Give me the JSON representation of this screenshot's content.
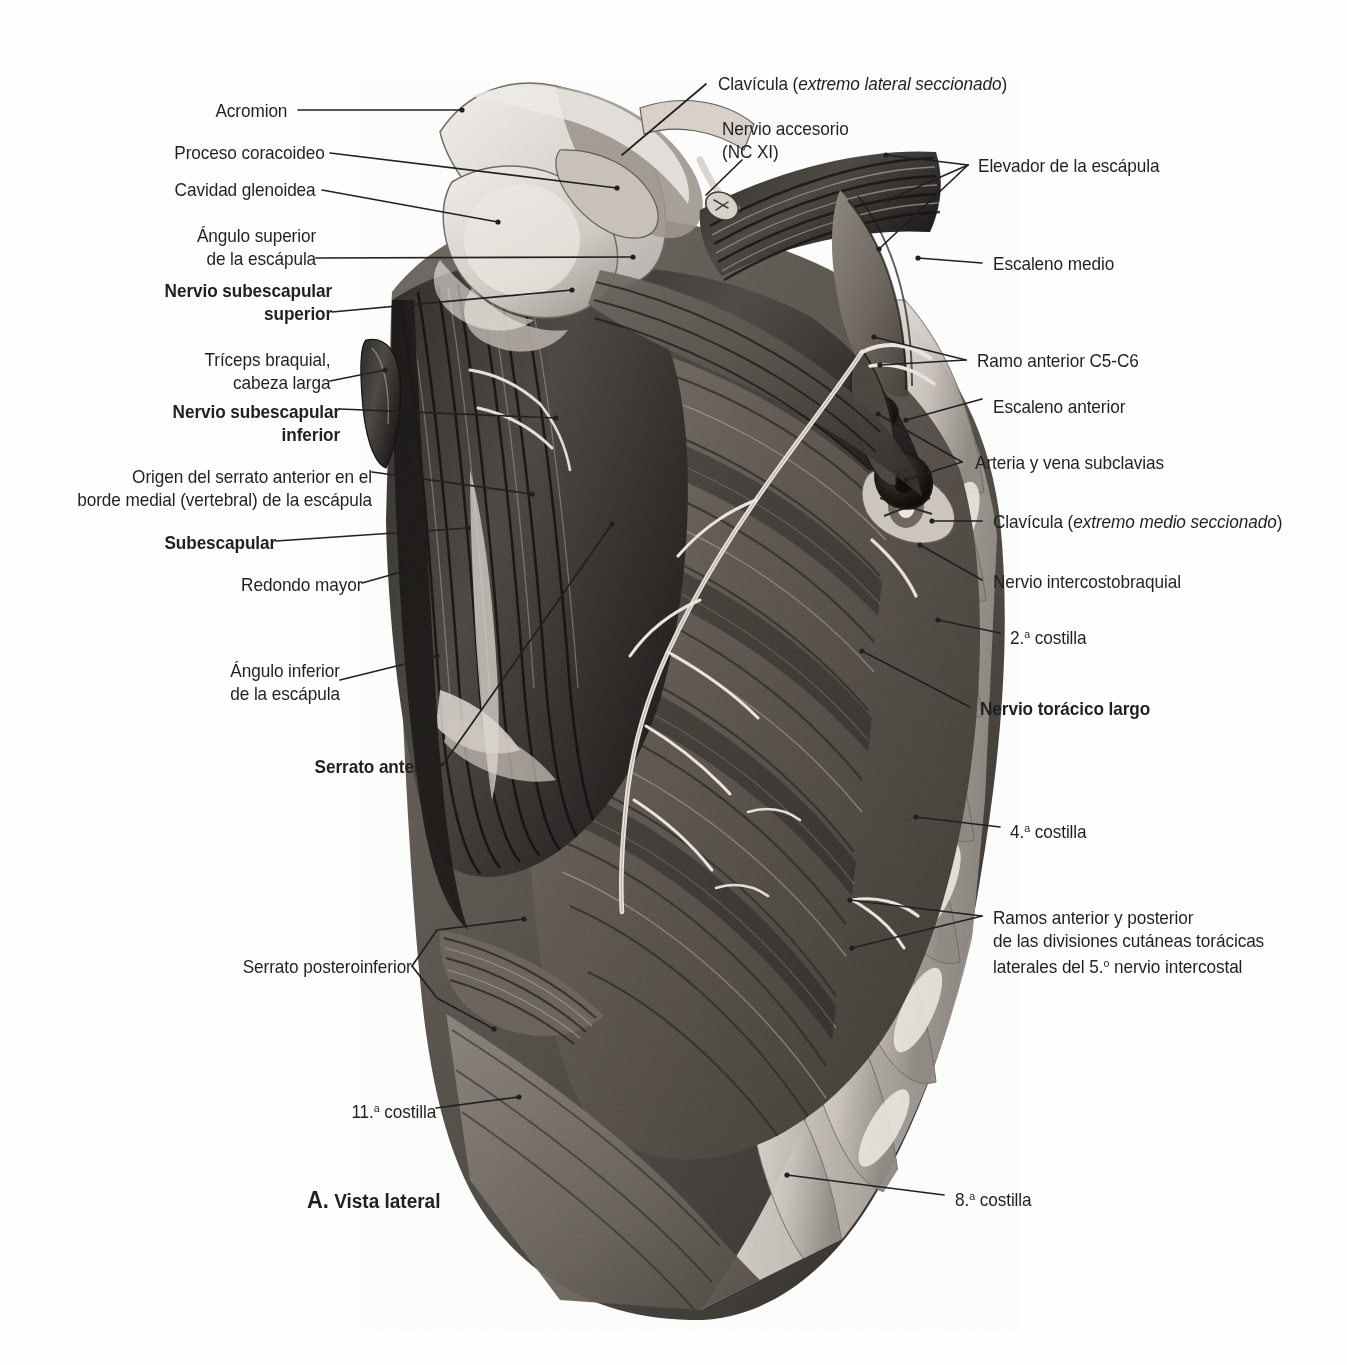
{
  "figure": {
    "caption_letter": "A.",
    "caption_text": " Vista lateral",
    "view": "Vista lateral",
    "background_color": "#fefefe",
    "ink_color": "#231f20"
  },
  "labels_left": [
    {
      "id": "acromion",
      "text": "Acromion",
      "bold": false
    },
    {
      "id": "proceso-coracoideo",
      "text": "Proceso coracoideo",
      "bold": false
    },
    {
      "id": "cavidad-glenoidea",
      "text": "Cavidad glenoidea",
      "bold": false
    },
    {
      "id": "angulo-superior-escapula",
      "line1": "Ángulo superior",
      "line2": "de la escápula",
      "bold": false
    },
    {
      "id": "nervio-subescapular-superior",
      "line1": "Nervio subescapular",
      "line2": "superior",
      "bold": true
    },
    {
      "id": "triceps-braquial-cabeza-larga",
      "line1": "Tríceps braquial,",
      "line2": "cabeza larga",
      "bold": false
    },
    {
      "id": "nervio-subescapular-inferior",
      "line1": "Nervio subescapular",
      "line2": "inferior",
      "bold": true
    },
    {
      "id": "origen-serrato-anterior",
      "line1": "Origen del serrato anterior en el",
      "line2": "borde medial (vertebral) de la escápula",
      "bold": false
    },
    {
      "id": "subescapular",
      "text": "Subescapular",
      "bold": true
    },
    {
      "id": "redondo-mayor",
      "text": "Redondo mayor",
      "bold": false
    },
    {
      "id": "angulo-inferior-escapula",
      "line1": "Ángulo inferior",
      "line2": "de la escápula",
      "bold": false
    },
    {
      "id": "serrato-anterior",
      "text": "Serrato anterior",
      "bold": true
    },
    {
      "id": "serrato-posteroinferior",
      "text": "Serrato posteroinferior",
      "bold": false
    },
    {
      "id": "costilla-11",
      "text_pre": "11.",
      "text_sup": "a",
      "text_post": " costilla",
      "bold": false
    }
  ],
  "labels_right": [
    {
      "id": "clavicula-lateral",
      "text_pre": "Clavícula (",
      "text_italic": "extremo lateral seccionado",
      "text_post": ")",
      "bold": false
    },
    {
      "id": "nervio-accesorio",
      "line1": "Nervio accesorio",
      "line2": "(NC XI)",
      "bold": false
    },
    {
      "id": "elevador-escapula",
      "text": "Elevador de la escápula",
      "bold": false
    },
    {
      "id": "escaleno-medio",
      "text": "Escaleno medio",
      "bold": false
    },
    {
      "id": "ramo-anterior-c5-c6",
      "text": "Ramo anterior C5-C6",
      "bold": false
    },
    {
      "id": "escaleno-anterior",
      "text": "Escaleno anterior",
      "bold": false
    },
    {
      "id": "arteria-vena-subclavias",
      "text": "Arteria y vena subclavias",
      "bold": false
    },
    {
      "id": "clavicula-medial",
      "text_pre": "Clavícula (",
      "text_italic": "extremo medio seccionado",
      "text_post": ")",
      "bold": false
    },
    {
      "id": "nervio-intercostobraquial",
      "text": "Nervio intercostobraquial",
      "bold": false
    },
    {
      "id": "costilla-2",
      "text_pre": "2.",
      "text_sup": "a",
      "text_post": " costilla",
      "bold": false
    },
    {
      "id": "nervio-toracico-largo",
      "text": "Nervio torácico largo",
      "bold": true
    },
    {
      "id": "costilla-4",
      "text_pre": "4.",
      "text_sup": "a",
      "text_post": " costilla",
      "bold": false
    },
    {
      "id": "ramos-cutaneos-5-intercostal",
      "line1": "Ramos anterior y posterior",
      "line2": "de las divisiones cutáneas torácicas",
      "line3_pre": "laterales del 5.",
      "line3_sup": "o",
      "line3_post": " nervio intercostal",
      "bold": false
    },
    {
      "id": "costilla-8",
      "text_pre": "8.",
      "text_sup": "a",
      "text_post": " costilla",
      "bold": false
    }
  ]
}
